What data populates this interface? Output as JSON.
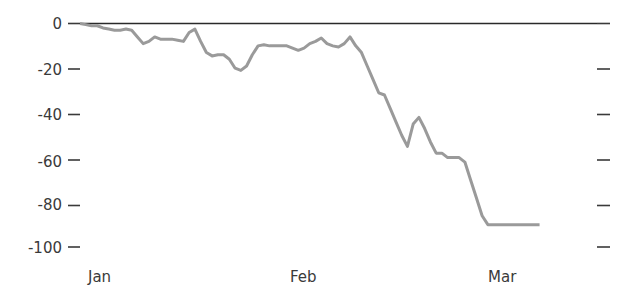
{
  "chart_data": {
    "type": "line",
    "title": "",
    "subtitle": "",
    "xlabel": "",
    "ylabel": "",
    "grid": false,
    "legend": null,
    "ylim": [
      -100,
      0
    ],
    "yticks": [
      0,
      -20,
      -40,
      -60,
      -80,
      -100
    ],
    "ytick_labels": [
      "0",
      "-20",
      "-40",
      "-60",
      "-80",
      "-100"
    ],
    "xtick_labels": [
      "Jan",
      "Feb",
      "Mar"
    ],
    "xtick_positions": [
      0,
      31,
      61
    ],
    "xlim": [
      0,
      90
    ],
    "right_axis_ticks": [
      0,
      -20,
      -40,
      -60,
      -80,
      -100
    ],
    "series": [
      {
        "name": "value",
        "color": "#9a9a9a",
        "x": [
          0,
          1,
          2,
          3,
          4,
          5,
          6,
          7,
          8,
          9,
          10,
          11,
          12,
          13,
          14,
          15,
          16,
          17,
          18,
          19,
          20,
          21,
          22,
          23,
          24,
          25,
          26,
          27,
          28,
          29,
          30,
          31,
          32,
          33,
          34,
          35,
          36,
          37,
          38,
          39,
          40,
          41,
          42,
          43,
          44,
          45,
          46,
          47,
          48,
          49,
          50,
          51,
          52,
          53,
          54,
          55,
          56,
          57,
          58,
          59,
          60,
          61,
          62,
          63,
          64,
          65,
          66,
          67,
          68,
          69,
          70,
          71,
          72,
          73,
          74,
          75,
          76,
          77,
          78,
          79,
          80
        ],
        "values": [
          0,
          -0.5,
          -1,
          -1,
          -2,
          -2.5,
          -3,
          -3,
          -2.5,
          -3,
          -6,
          -9,
          -8,
          -6,
          -7,
          -7,
          -7,
          -7.5,
          -8,
          -4,
          -2.5,
          -8,
          -13,
          -14.5,
          -14,
          -14,
          -16,
          -20,
          -21,
          -19,
          -14,
          -10,
          -9.5,
          -10,
          -10,
          -10,
          -10,
          -11,
          -12,
          -11,
          -9,
          -8,
          -6.5,
          -9,
          -10,
          -10.5,
          -9,
          -6,
          -10,
          -13,
          -19,
          -25,
          -31,
          -32,
          -38,
          -44,
          -50,
          -55,
          -45,
          -42,
          -47,
          -53,
          -58,
          -58,
          -60,
          -60,
          -60,
          -62,
          -70,
          -78,
          -86,
          -90,
          -90,
          -90,
          -90,
          -90,
          -90,
          -90,
          -90,
          -90,
          -90
        ]
      }
    ]
  }
}
